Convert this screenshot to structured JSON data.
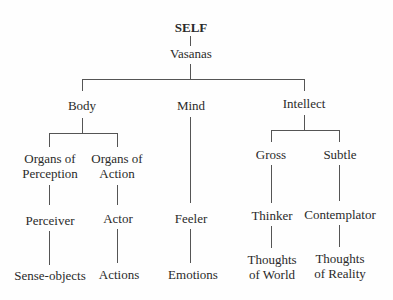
{
  "diagram": {
    "root": "SELF",
    "level1": "Vasanas",
    "branches": {
      "body": {
        "label": "Body",
        "perception": {
          "label1": "Organs of",
          "label2": "Perception",
          "agent": "Perceiver",
          "object": "Sense-objects"
        },
        "action": {
          "label1": "Organs of",
          "label2": "Action",
          "agent": "Actor",
          "object": "Actions"
        }
      },
      "mind": {
        "label": "Mind",
        "agent": "Feeler",
        "object": "Emotions"
      },
      "intellect": {
        "label": "Intellect",
        "gross": {
          "label": "Gross",
          "agent": "Thinker",
          "object1": "Thoughts",
          "object2": "of World"
        },
        "subtle": {
          "label": "Subtle",
          "agent": "Contemplator",
          "object1": "Thoughts",
          "object2": "of Reality"
        }
      }
    }
  }
}
